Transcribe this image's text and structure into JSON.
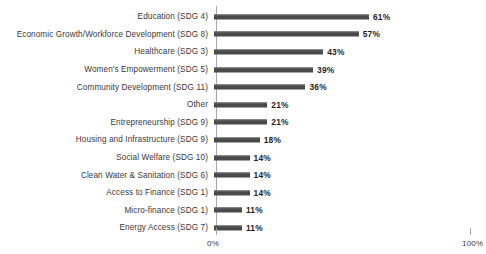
{
  "chart_data": {
    "type": "bar",
    "orientation": "horizontal",
    "title": "",
    "subtitle": "",
    "xlabel": "",
    "ylabel": "",
    "xlim": [
      0,
      100
    ],
    "grid": false,
    "legend": null,
    "value_suffix": "%",
    "axis_ticks": [
      {
        "value": 0,
        "label": "0%"
      },
      {
        "value": 100,
        "label": "100%"
      }
    ],
    "categories": [
      "Education (SDG 4)",
      "Economic Growth/Workforce Development (SDG 8)",
      "Healthcare (SDG 3)",
      "Women's Empowerment (SDG 5)",
      "Community Development (SDG 11)",
      "Other",
      "Entrepreneurship (SDG 9)",
      "Housing and Infrastructure (SDG 9)",
      "Social Welfare (SDG 10)",
      "Clean Water & Sanitation (SDG 6)",
      "Access to Finance (SDG 1)",
      "Micro-finance (SDG 1)",
      "Energy Access (SDG 7)"
    ],
    "values": [
      61,
      57,
      43,
      39,
      36,
      21,
      21,
      18,
      14,
      14,
      14,
      11,
      11
    ],
    "data_labels": [
      "61%",
      "57%",
      "43%",
      "39%",
      "36%",
      "21%",
      "21%",
      "18%",
      "14%",
      "14%",
      "14%",
      "11%",
      "11%"
    ],
    "bar_color": "#4a4a4a",
    "axis_color": "#aaaaaa",
    "text_color": "#3a3a3a",
    "background": "#ffffff"
  }
}
